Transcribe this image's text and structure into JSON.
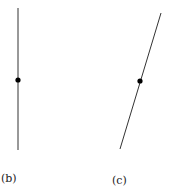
{
  "figure": {
    "panels": [
      {
        "label": "(b)",
        "description": "vertical line segment with a point at its midpoint",
        "line": {
          "x1": 18,
          "y1": 8,
          "x2": 18,
          "y2": 150
        },
        "point": {
          "x": 18,
          "y": 80
        }
      },
      {
        "label": "(c)",
        "description": "tilted line segment with a point at its midpoint",
        "line": {
          "x1": 161,
          "y1": 13,
          "x2": 120,
          "y2": 149
        },
        "point": {
          "x": 140,
          "y": 81
        }
      }
    ],
    "colors": {
      "line": "#333333",
      "point": "#000000",
      "background": "#ffffff"
    }
  }
}
